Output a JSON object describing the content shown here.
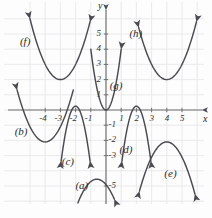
{
  "figure": {
    "axis_x_label": "x",
    "axis_y_label": "y",
    "grid": true,
    "grid_color": "#e8e6ea",
    "axis_color": "#6f6f6f",
    "curve_color": "#4a4a52",
    "background": "#fdfdfd"
  },
  "axes": {
    "x_ticks": [
      "-4",
      "-3",
      "-2",
      "-1",
      "1",
      "2",
      "3",
      "4",
      "5"
    ],
    "y_ticks": [
      "5",
      "4",
      "3",
      "2",
      "1",
      "-1",
      "-2",
      "-3",
      "-5"
    ],
    "xlim": [
      -5.9,
      6.4
    ],
    "ylim": [
      -6.1,
      6.2
    ]
  },
  "chart_data": {
    "type": "line",
    "xlabel": "x",
    "ylabel": "y",
    "xlim": [
      -5.9,
      6.4
    ],
    "ylim": [
      -6.1,
      6.2
    ],
    "grid": true,
    "legend": "inline-labels",
    "x_ticks": [
      -4,
      -3,
      -2,
      -1,
      1,
      2,
      3,
      4,
      5
    ],
    "y_ticks": [
      5,
      4,
      3,
      2,
      1,
      -1,
      -2,
      -3,
      -5
    ],
    "series": [
      {
        "name": "(a)",
        "vertex_x": -0.6,
        "vertex_y": -4.55,
        "a": -1.0,
        "x_start": -1.85,
        "x_end": 0.55,
        "label_x": -1.55,
        "label_y": -5.0,
        "arrow_start": false,
        "arrow_end": true
      },
      {
        "name": "(b)",
        "vertex_x": -4.0,
        "vertex_y": -2.1,
        "a": 1.0,
        "x_start": -5.85,
        "x_end": -2.15,
        "label_x": -5.55,
        "label_y": -1.45,
        "arrow_start": true,
        "arrow_end": false
      },
      {
        "name": "(c)",
        "vertex_x": -2.0,
        "vertex_y": 0.25,
        "a": -4.0,
        "x_start": -2.95,
        "x_end": -1.05,
        "label_x": -2.45,
        "label_y": -3.45,
        "arrow_start": true,
        "arrow_end": true
      },
      {
        "name": "(d)",
        "vertex_x": 2.0,
        "vertex_y": 0.25,
        "a": -4.0,
        "x_start": 1.05,
        "x_end": 2.95,
        "label_x": 1.35,
        "label_y": -2.65,
        "arrow_start": true,
        "arrow_end": true
      },
      {
        "name": "(e)",
        "vertex_x": 4.0,
        "vertex_y": -2.1,
        "a": -1.0,
        "x_start": 2.2,
        "x_end": 5.85,
        "label_x": 4.3,
        "label_y": -4.2,
        "arrow_start": true,
        "arrow_end": true
      },
      {
        "name": "(f)",
        "vertex_x": -3.0,
        "vertex_y": 2.0,
        "a": 1.0,
        "x_start": -5.0,
        "x_end": -1.05,
        "label_x": -5.2,
        "label_y": 4.5,
        "arrow_start": true,
        "arrow_end": true
      },
      {
        "name": "(g)",
        "vertex_x": 0.0,
        "vertex_y": 0.0,
        "a": 4.0,
        "x_start": -1.0,
        "x_end": 1.0,
        "label_x": 0.7,
        "label_y": 1.55,
        "arrow_start": false,
        "arrow_end": true
      },
      {
        "name": "(h)",
        "vertex_x": 4.0,
        "vertex_y": 2.0,
        "a": 1.0,
        "x_start": 2.15,
        "x_end": 5.95,
        "label_x": 2.0,
        "label_y": 5.0,
        "arrow_start": true,
        "arrow_end": true
      }
    ]
  }
}
